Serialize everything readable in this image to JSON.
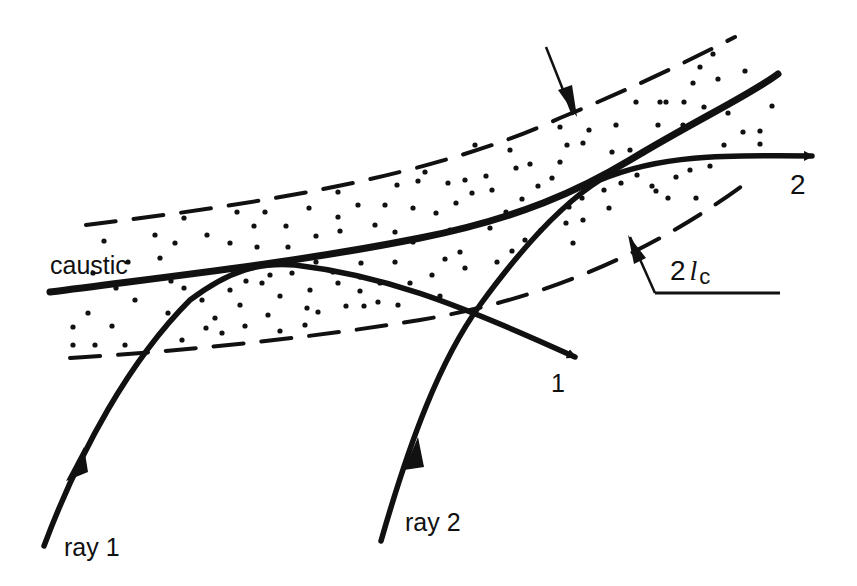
{
  "diagram": {
    "type": "caustic-ray-diagram",
    "colors": {
      "ink": "#111111",
      "background": "#ffffff"
    },
    "labels": {
      "caustic": "caustic",
      "ray1": "ray 1",
      "ray2": "ray 2",
      "out1": "1",
      "out2": "2",
      "width_prefix": "2",
      "width_l": "l",
      "width_sub": "c"
    },
    "elements": [
      {
        "name": "caustic-curve",
        "style": "thick solid"
      },
      {
        "name": "caustic-zone-upper-boundary",
        "style": "dashed"
      },
      {
        "name": "caustic-zone-lower-boundary",
        "style": "dashed"
      },
      {
        "name": "caustic-zone-fill",
        "style": "stippled dots"
      },
      {
        "name": "ray-1",
        "style": "solid arrowed, tangent to caustic, exits as ray 1"
      },
      {
        "name": "ray-2",
        "style": "solid arrowed, tangent to caustic, exits as ray 2"
      },
      {
        "name": "width-indicator",
        "label": "2 l_c",
        "style": "two leader arrows pointing to dashed boundaries"
      }
    ]
  }
}
